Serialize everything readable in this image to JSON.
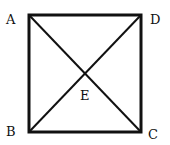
{
  "diagram": {
    "type": "square-with-diagonals",
    "vertices": [
      {
        "label": "A",
        "x": 29,
        "y": 15
      },
      {
        "label": "D",
        "x": 142,
        "y": 15
      },
      {
        "label": "C",
        "x": 140,
        "y": 132
      },
      {
        "label": "B",
        "x": 29,
        "y": 132
      }
    ],
    "intersection": {
      "label": "E",
      "x": 85,
      "y": 74
    },
    "labels": {
      "A": "A",
      "B": "B",
      "C": "C",
      "D": "D",
      "E": "E"
    },
    "stroke_color": "#111111"
  }
}
